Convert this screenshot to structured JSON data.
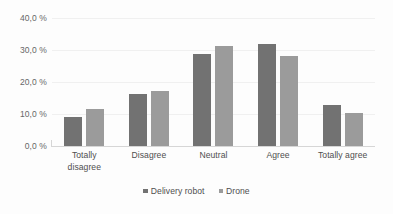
{
  "chart_data": {
    "type": "bar",
    "title": "",
    "subtitle": "",
    "xlabel": "",
    "ylabel": "",
    "ylim": [
      0,
      40
    ],
    "ytick_labels": [
      "40,0 %",
      "30,0 %",
      "20,0 %",
      "10,0 %",
      "0,0 %"
    ],
    "ytick_values": [
      40,
      30,
      20,
      10,
      0
    ],
    "grid": "horizontal",
    "legend_position": "bottom",
    "categories": [
      "Totally disagree",
      "Disagree",
      "Neutral",
      "Agree",
      "Totally agree"
    ],
    "category_lines": [
      [
        "Totally",
        "disagree"
      ],
      [
        "Disagree"
      ],
      [
        "Neutral"
      ],
      [
        "Agree"
      ],
      [
        "Totally agree"
      ]
    ],
    "series": [
      {
        "name": "Delivery robot",
        "color": "#727272",
        "values": [
          9.1,
          16.2,
          28.8,
          32.0,
          12.7
        ]
      },
      {
        "name": "Drone",
        "color": "#9b9b9b",
        "values": [
          11.6,
          17.2,
          31.3,
          28.2,
          10.3
        ]
      }
    ],
    "colors": {
      "series_delivery_robot": "#727272",
      "series_drone": "#9b9b9b",
      "gridline": "#f0f0f0",
      "axis_line": "#d6d6d6",
      "label_text": "#4f4f4f",
      "tick_text": "#676767",
      "background": "#fdfdfd"
    }
  }
}
